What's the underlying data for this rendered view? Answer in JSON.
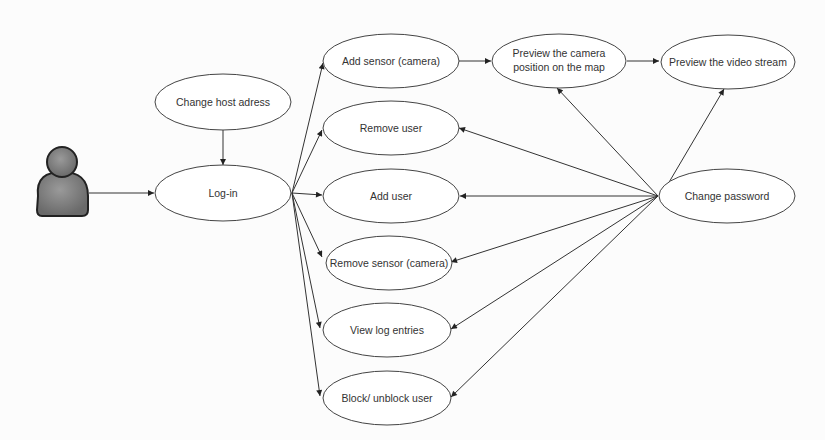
{
  "diagram": {
    "type": "use-case",
    "actor": {
      "name": "user-actor"
    },
    "use_cases": [
      {
        "id": "host",
        "label": "Change host adress"
      },
      {
        "id": "login",
        "label": "Log-in"
      },
      {
        "id": "addsensor",
        "label": "Add sensor (camera)"
      },
      {
        "id": "removeuser",
        "label": "Remove user"
      },
      {
        "id": "adduser",
        "label": "Add user"
      },
      {
        "id": "removesensor",
        "label": "Remove sensor (camera)"
      },
      {
        "id": "viewlog",
        "label": "View log entries"
      },
      {
        "id": "block",
        "label": "Block/ unblock user"
      },
      {
        "id": "preview_map",
        "label_line1": "Preview the camera",
        "label_line2": "position on the map"
      },
      {
        "id": "preview_video",
        "label": "Preview the video stream"
      },
      {
        "id": "changepw",
        "label": "Change password"
      }
    ],
    "edges": [
      [
        "actor",
        "login"
      ],
      [
        "host",
        "login"
      ],
      [
        "login",
        "addsensor"
      ],
      [
        "login",
        "removeuser"
      ],
      [
        "login",
        "adduser"
      ],
      [
        "login",
        "removesensor"
      ],
      [
        "login",
        "viewlog"
      ],
      [
        "login",
        "block"
      ],
      [
        "addsensor",
        "preview_map"
      ],
      [
        "preview_map",
        "preview_video"
      ],
      [
        "changepw",
        "preview_map"
      ],
      [
        "changepw",
        "preview_video"
      ],
      [
        "changepw",
        "removeuser"
      ],
      [
        "changepw",
        "adduser"
      ],
      [
        "changepw",
        "removesensor"
      ],
      [
        "changepw",
        "viewlog"
      ],
      [
        "changepw",
        "block"
      ]
    ]
  }
}
